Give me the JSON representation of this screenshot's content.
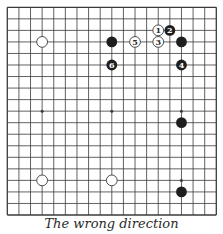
{
  "diagram": {
    "type": "go-board",
    "size": 19,
    "caption": "The wrong direction",
    "colors": {
      "line": "#3a3a3a",
      "black_stone": "#1e1e1e",
      "white_stone_fill": "#ffffff",
      "white_stone_stroke": "#3a3a3a",
      "background": "#ffffff"
    },
    "star_points": [
      [
        3,
        3
      ],
      [
        9,
        3
      ],
      [
        15,
        3
      ],
      [
        3,
        9
      ],
      [
        9,
        9
      ],
      [
        15,
        9
      ],
      [
        3,
        15
      ],
      [
        9,
        15
      ],
      [
        15,
        15
      ]
    ],
    "stones": [
      {
        "col": 3,
        "row": 3,
        "color": "white",
        "label": ""
      },
      {
        "col": 9,
        "row": 3,
        "color": "black",
        "label": ""
      },
      {
        "col": 15,
        "row": 3,
        "color": "black",
        "label": ""
      },
      {
        "col": 15,
        "row": 10,
        "color": "black",
        "label": ""
      },
      {
        "col": 15,
        "row": 16,
        "color": "black",
        "label": ""
      },
      {
        "col": 3,
        "row": 15,
        "color": "white",
        "label": ""
      },
      {
        "col": 9,
        "row": 15,
        "color": "white",
        "label": ""
      },
      {
        "col": 13,
        "row": 2,
        "color": "white",
        "label": "1"
      },
      {
        "col": 14,
        "row": 2,
        "color": "black",
        "label": "2"
      },
      {
        "col": 13,
        "row": 3,
        "color": "white",
        "label": "3"
      },
      {
        "col": 15,
        "row": 5,
        "color": "black",
        "label": "4"
      },
      {
        "col": 11,
        "row": 3,
        "color": "white",
        "label": "5"
      },
      {
        "col": 9,
        "row": 5,
        "color": "black",
        "label": "6"
      }
    ]
  }
}
